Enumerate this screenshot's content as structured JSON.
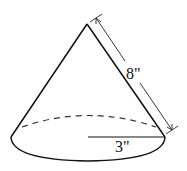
{
  "figure": {
    "type": "cone",
    "slant_height_label": "8\"",
    "radius_label": "3\"",
    "slant_height": 8,
    "radius": 3,
    "units": "inches"
  }
}
